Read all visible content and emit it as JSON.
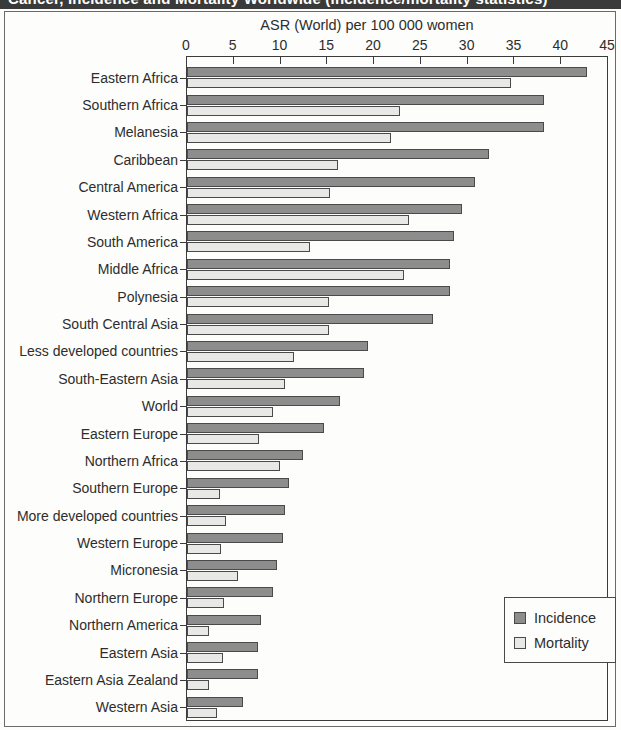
{
  "header": {
    "title": "Cancer, Incidence and Mortality Worldwide (incidence/mortality statistics)"
  },
  "chart_data": {
    "type": "bar",
    "orientation": "horizontal",
    "title": "",
    "xlabel": "ASR (World) per 100 000 women",
    "ylabel": "",
    "xlim": [
      0,
      45
    ],
    "xticks": [
      0,
      5,
      10,
      15,
      20,
      25,
      30,
      35,
      40,
      45
    ],
    "grid": false,
    "legend_position": "bottom-right",
    "categories": [
      "Eastern Africa",
      "Southern Africa",
      "Melanesia",
      "Caribbean",
      "Central America",
      "Western Africa",
      "South America",
      "Middle Africa",
      "Polynesia",
      "South Central Asia",
      "Less developed countries",
      "South-Eastern Asia",
      "World",
      "Eastern Europe",
      "Northern Africa",
      "Southern Europe",
      "More developed countries",
      "Western Europe",
      "Micronesia",
      "Northern Europe",
      "Northern America",
      "Eastern Asia",
      "Eastern Asia Zealand",
      "Western Asia"
    ],
    "series": [
      {
        "name": "Incidence",
        "color": "#8d8d8d",
        "values": [
          42.8,
          38.2,
          38.2,
          32.3,
          30.8,
          29.4,
          28.5,
          28.1,
          28.1,
          26.3,
          19.4,
          18.9,
          16.4,
          14.6,
          12.4,
          10.9,
          10.5,
          10.3,
          9.6,
          9.2,
          7.9,
          7.6,
          7.6,
          6.0
        ]
      },
      {
        "name": "Mortality",
        "color": "#e8e8e6",
        "values": [
          34.6,
          22.8,
          21.8,
          16.1,
          15.3,
          23.7,
          13.1,
          23.2,
          15.2,
          15.2,
          11.4,
          10.5,
          9.2,
          7.7,
          9.9,
          3.5,
          4.2,
          3.6,
          5.5,
          4.0,
          2.4,
          3.9,
          2.3,
          3.2
        ]
      }
    ]
  },
  "legend": {
    "items": [
      {
        "label": "Incidence",
        "key": "incidence"
      },
      {
        "label": "Mortality",
        "key": "mortality"
      }
    ]
  }
}
